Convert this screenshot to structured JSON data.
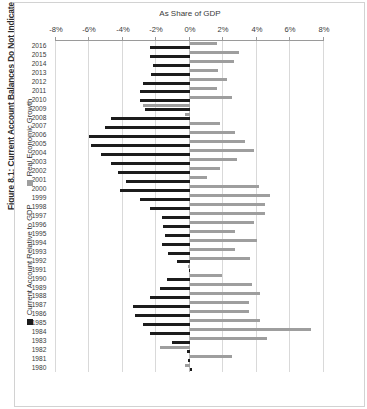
{
  "figure": {
    "title": "Figure 8.1: Current Account Balances Do Not Indicate Economic Strength"
  },
  "legend": {
    "position": "right",
    "items": [
      {
        "label": "Current Account Relative to GDP",
        "color": "#1c1c1c",
        "key": "current_account"
      },
      {
        "label": "Real Economic Growth",
        "color": "#9e9e9e",
        "key": "growth"
      }
    ]
  },
  "axes": {
    "value_axis_title": "As Share of GDP",
    "value_ticks": [
      "8%",
      "6%",
      "4%",
      "2%",
      "0%",
      "-2%",
      "-4%",
      "-6%",
      "-8%"
    ],
    "value_tick_numbers": [
      8,
      6,
      4,
      2,
      0,
      -2,
      -4,
      -6,
      -8
    ],
    "value_min": -8,
    "value_max": 8,
    "grid": true
  },
  "chart_data": {
    "type": "bar",
    "orientation": "horizontal",
    "title": "Figure 8.1: Current Account Balances Do Not Indicate Economic Strength",
    "xlabel": "As Share of GDP",
    "ylabel": "",
    "xlim": [
      -8,
      8
    ],
    "grid": true,
    "legend_position": "right",
    "categories": [
      "1980",
      "1981",
      "1982",
      "1983",
      "1984",
      "1985",
      "1986",
      "1987",
      "1988",
      "1989",
      "1990",
      "1991",
      "1992",
      "1993",
      "1994",
      "1995",
      "1996",
      "1997",
      "1998",
      "1999",
      "2000",
      "2001",
      "2002",
      "2003",
      "2004",
      "2005",
      "2006",
      "2007",
      "2008",
      "2009",
      "2010",
      "2011",
      "2012",
      "2013",
      "2014",
      "2015",
      "2016"
    ],
    "series": [
      {
        "name": "Current Account Relative to GDP",
        "color": "#1c1c1c",
        "values": [
          0.1,
          -0.1,
          -0.2,
          -1.1,
          -2.4,
          -2.8,
          -3.3,
          -3.4,
          -2.4,
          -1.8,
          -1.4,
          0.0,
          -0.8,
          -1.3,
          -1.7,
          -1.5,
          -1.6,
          -1.7,
          -2.4,
          -3.0,
          -4.2,
          -3.8,
          -4.3,
          -4.7,
          -5.3,
          -5.9,
          -6.0,
          -5.1,
          -4.7,
          -2.7,
          -3.0,
          -3.0,
          -2.8,
          -2.3,
          -2.2,
          -2.4,
          -2.4
        ]
      },
      {
        "name": "Real Economic Growth",
        "color": "#9e9e9e",
        "values": [
          -0.3,
          2.5,
          -1.8,
          4.6,
          7.2,
          4.2,
          3.5,
          3.5,
          4.2,
          3.7,
          1.9,
          -0.1,
          3.6,
          2.7,
          4.0,
          2.7,
          3.8,
          4.5,
          4.5,
          4.8,
          4.1,
          1.0,
          1.8,
          2.8,
          3.8,
          3.3,
          2.7,
          1.8,
          -0.3,
          -2.8,
          2.5,
          1.6,
          2.2,
          1.7,
          2.6,
          2.9,
          1.6
        ]
      }
    ]
  }
}
